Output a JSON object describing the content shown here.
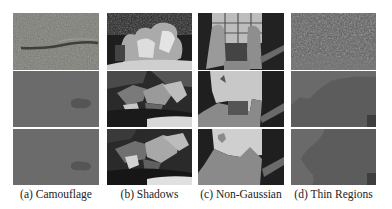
{
  "figure": {
    "columns": [
      {
        "id": "a",
        "caption": "(a) Camouflage",
        "rows": [
          "input-image",
          "segmentation-1",
          "segmentation-2"
        ]
      },
      {
        "id": "b",
        "caption": "(b) Shadows",
        "rows": [
          "input-image",
          "segmentation-1",
          "segmentation-2"
        ]
      },
      {
        "id": "c",
        "caption": "(c) Non-Gaussian",
        "rows": [
          "input-image",
          "segmentation-1",
          "segmentation-2"
        ]
      },
      {
        "id": "d",
        "caption": "(d) Thin Regions",
        "rows": [
          "input-image",
          "segmentation-1",
          "segmentation-2"
        ]
      }
    ]
  }
}
